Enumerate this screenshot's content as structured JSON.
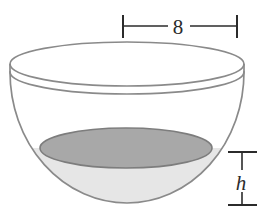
{
  "figure": {
    "type": "geometry-diagram",
    "shape": "hemisphere-bowl",
    "colors": {
      "outline": "#808080",
      "rim_outline": "#7a7a7a",
      "liquid_surface_fill": "#a8a8a8",
      "liquid_surface_stroke": "#808080",
      "liquid_body_fill": "#e6e6e6",
      "bowl_interior_fill": "#ffffff",
      "dimension_line": "#2b2b2b",
      "background": "#ffffff"
    },
    "bowl": {
      "rim_ellipse": {
        "cx": 127,
        "cy": 64,
        "rx": 117,
        "ry": 22
      },
      "rim_lower_ellipse": {
        "cx": 127,
        "cy": 72,
        "rx": 117,
        "ry": 22
      },
      "body_bottom_y": 203,
      "wall_left_x": 10,
      "wall_right_x": 244
    },
    "liquid": {
      "surface_ellipse": {
        "cx": 126,
        "cy": 148,
        "rx": 86,
        "ry": 20
      },
      "depth_label": "h"
    },
    "dimensions": [
      {
        "name": "width-dimension",
        "label": "8",
        "orientation": "horizontal",
        "line_y": 26,
        "tick_left_x": 123,
        "tick_right_x": 237,
        "tick_top_y": 15,
        "tick_bottom_y": 38,
        "label_x": 178,
        "label_y": 34
      },
      {
        "name": "height-dimension",
        "label": "h",
        "orientation": "vertical",
        "line_x": 242,
        "tick_top_y": 152,
        "tick_bottom_y": 205,
        "tick_left_x": 228,
        "tick_right_x": 257,
        "label_x": 241,
        "label_y": 187
      }
    ]
  }
}
